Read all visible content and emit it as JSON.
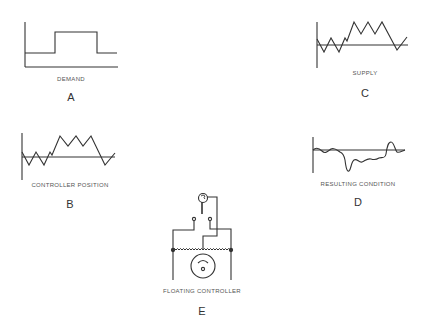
{
  "panels": {
    "a": {
      "caption": "DEMAND",
      "letter": "A"
    },
    "b": {
      "caption": "CONTROLLER POSITION",
      "letter": "B"
    },
    "c": {
      "caption": "SUPPLY",
      "letter": "C"
    },
    "d": {
      "caption": "RESULTING CONDITION",
      "letter": "D"
    },
    "e": {
      "caption": "FLOATING CONTROLLER",
      "letter": "E"
    }
  },
  "colors": {
    "line": "#333333",
    "background": "#ffffff"
  }
}
